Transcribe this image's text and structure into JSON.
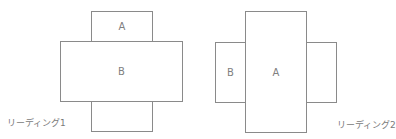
{
  "diagrams": [
    {
      "caption": "リーディング1",
      "boxes": [
        {
          "id": "top",
          "label": "A"
        },
        {
          "id": "middle",
          "label": "B"
        },
        {
          "id": "bottom",
          "label": ""
        }
      ]
    },
    {
      "caption": "リーディング2",
      "boxes": [
        {
          "id": "left",
          "label": "B"
        },
        {
          "id": "center",
          "label": "A"
        },
        {
          "id": "right",
          "label": ""
        }
      ]
    }
  ],
  "colors": {
    "stroke": "#8a8a8a",
    "text": "#7a7a7a",
    "background": "#ffffff"
  }
}
